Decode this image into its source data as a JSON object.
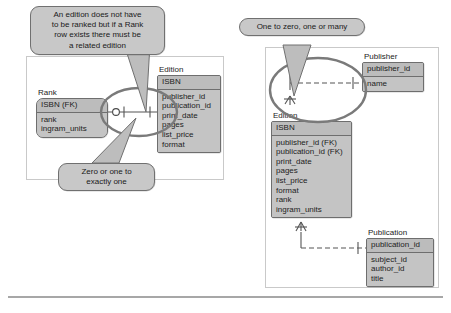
{
  "page": {
    "background_color": "#ffffff",
    "entity_fill": "#c2c2c2",
    "entity_border": "#6e6e6e",
    "callout_fill": "#c8c8c8",
    "highlight_stroke": "#7a7a7a",
    "frame_border": "#c9c9c9"
  },
  "left_diagram": {
    "name": "rank-edition-relationship",
    "callout": {
      "text": "An edition does not have\nto be ranked but if a Rank\nrow exists there must be\na related edition"
    },
    "callout_cardinality": {
      "text": "Zero or one to\nexactly one"
    },
    "entities": [
      {
        "name": "Rank",
        "key_field": "ISBN (FK)",
        "fields": [
          "rank",
          "ingram_units"
        ]
      },
      {
        "name": "Edition",
        "key_field": "ISBN",
        "fields": [
          "publisher_id",
          "publication_id",
          "print_date",
          "pages",
          "list_price",
          "format"
        ]
      }
    ],
    "relationship": {
      "from": "Rank",
      "to": "Edition",
      "from_cardinality": "zero-or-one",
      "to_cardinality": "exactly-one",
      "line_style": "solid"
    }
  },
  "right_diagram": {
    "name": "publisher-edition-publication-relationships",
    "callout": {
      "text": "One to zero, one or many"
    },
    "entities": [
      {
        "name": "Publisher",
        "key_field": "publisher_id",
        "fields": [
          "name"
        ]
      },
      {
        "name": "Edition",
        "key_field": "ISBN",
        "fields": [
          "publisher_id (FK)",
          "publication_id (FK)",
          "print_date",
          "pages",
          "list_price",
          "format",
          "rank",
          "ingram_units"
        ]
      },
      {
        "name": "Publication",
        "key_field": "publication_id",
        "fields": [
          "subject_id",
          "author_id",
          "title"
        ]
      }
    ],
    "relationships": [
      {
        "from": "Edition",
        "to": "Publisher",
        "from_cardinality": "zero-one-or-many",
        "to_cardinality": "exactly-one",
        "line_style": "dashed"
      },
      {
        "from": "Edition",
        "to": "Publication",
        "from_cardinality": "zero-one-or-many",
        "to_cardinality": "exactly-one",
        "line_style": "dashed"
      }
    ]
  }
}
